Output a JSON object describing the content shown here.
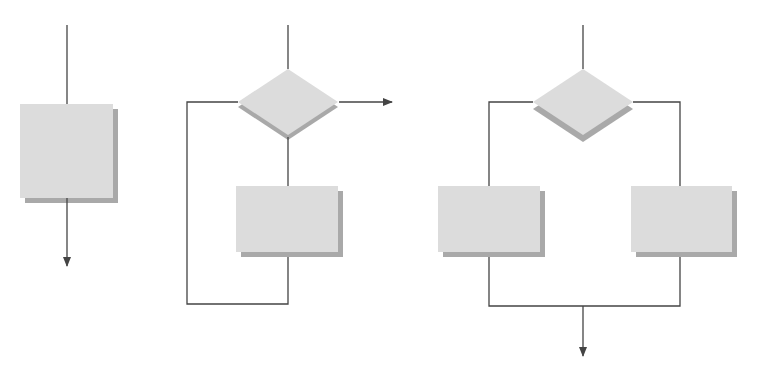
{
  "diagram": {
    "title": "",
    "colors": {
      "background": "#ffffff",
      "line": "#444444",
      "shape_fill": "#dcdcdc",
      "shape_shadow": "#a9a9a9"
    },
    "structures": [
      {
        "id": "sequence",
        "label": "",
        "shapes": [
          {
            "type": "process",
            "x": 20,
            "y": 104,
            "w": 93,
            "h": 94
          }
        ]
      },
      {
        "id": "loop",
        "label": "",
        "shapes": [
          {
            "type": "decision",
            "cx": 288,
            "cy": 102,
            "hw": 50,
            "hh": 33
          },
          {
            "type": "process",
            "x": 236,
            "y": 186,
            "w": 102,
            "h": 66
          }
        ]
      },
      {
        "id": "selection",
        "label": "",
        "shapes": [
          {
            "type": "decision",
            "cx": 583,
            "cy": 102,
            "hw": 50,
            "hh": 33
          },
          {
            "type": "process",
            "x": 438,
            "y": 186,
            "w": 102,
            "h": 66
          },
          {
            "type": "process",
            "x": 631,
            "y": 186,
            "w": 101,
            "h": 66
          }
        ]
      }
    ]
  }
}
